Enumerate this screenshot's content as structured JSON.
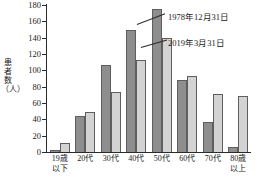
{
  "chart_data": {
    "type": "bar",
    "title": "",
    "xlabel": "",
    "ylabel": "患者数（人）",
    "ylim": [
      0,
      180
    ],
    "yticks": [
      0,
      20,
      40,
      60,
      80,
      100,
      120,
      140,
      160,
      180
    ],
    "grid": false,
    "legend_position": "inside-right",
    "categories": [
      "19歳\n以下",
      "20代",
      "30代",
      "40代",
      "50代",
      "60代",
      "70代",
      "80歳\n以上"
    ],
    "series": [
      {
        "name": "1978年12月31日",
        "color": "#8e8e8e",
        "values": [
          2,
          44,
          106,
          150,
          175,
          88,
          37,
          6
        ]
      },
      {
        "name": "2019年3月31日",
        "color": "#d3d3d3",
        "values": [
          11,
          49,
          74,
          113,
          139,
          93,
          71,
          69
        ]
      }
    ]
  }
}
